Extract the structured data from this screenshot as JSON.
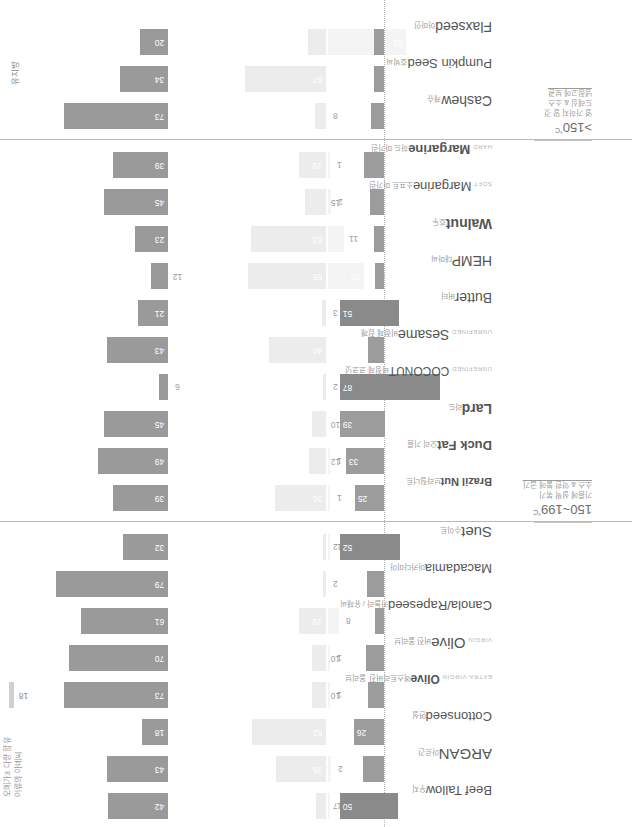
{
  "meta": {
    "fat_axis_title": "유지방",
    "omega_note_line1": "오메가3 다량 함유",
    "omega_note_line2": "어류의 아녜씨"
  },
  "colors": {
    "mono": "#9a9a9a",
    "poly": "#ececec",
    "saturated": "#9c9c9c",
    "saturated_dark": "#8a8a8a",
    "divider": "#b9b9b9",
    "zeroline": "#b0b0b0",
    "text": "#555555",
    "text_muted": "#9b9b9b"
  },
  "annotation": {
    "small_bar_value": "18"
  },
  "temperature_sections": [
    {
      "id": "sec-mid",
      "degree": "150~199",
      "unit": "°C",
      "use_lines": [
        "기름에 살짝 볶기",
        "소스 & 약한 불에 굽기"
      ]
    },
    {
      "id": "sec-low",
      "degree": ">150",
      "unit": "°C",
      "use_lines": [
        "열 가하지 말 것",
        "드레싱 & 소스",
        "냉장고에 보관"
      ]
    }
  ],
  "chart_data": {
    "type": "bar",
    "title": "유지방",
    "xlabel": "",
    "ylabel": "",
    "grid": false,
    "legend": "none",
    "series": [
      {
        "name": "monounsaturated",
        "values": [
          42,
          43,
          18,
          73,
          70,
          61,
          79,
          32,
          39,
          49,
          45,
          6,
          43,
          21,
          12,
          23,
          45,
          39,
          73,
          34,
          20
        ]
      },
      {
        "name": "polyunsaturated",
        "values": [
          7,
          35,
          52,
          10,
          10,
          19,
          2,
          2,
          36,
          12,
          10,
          2,
          40,
          3,
          55,
          53,
          15,
          19,
          8,
          57,
          13
        ]
      },
      {
        "name": "polyunsaturated_secondary",
        "values": [
          1,
          2,
          0,
          1,
          1,
          8,
          0,
          1,
          1,
          1,
          0,
          0,
          0,
          0,
          25,
          11,
          2,
          1,
          0,
          0,
          55
        ]
      },
      {
        "name": "saturated",
        "values": [
          50,
          18,
          26,
          14,
          16,
          8,
          15,
          52,
          25,
          33,
          39,
          87,
          14,
          51,
          8,
          9,
          12,
          17,
          11,
          9,
          9
        ]
      }
    ],
    "categories": [
      {
        "pre": "",
        "en": "Beef Tallow",
        "ko": "우지",
        "bold": false,
        "size": 13,
        "section": "sec-top"
      },
      {
        "pre": "",
        "en": "ARGAN",
        "ko": "아르간",
        "bold": false,
        "size": 15,
        "section": "sec-top"
      },
      {
        "pre": "",
        "en": "Cottonseed",
        "ko": "면실",
        "bold": false,
        "size": 13,
        "section": "sec-top"
      },
      {
        "pre": "EXTRA-VIRGIN",
        "en": "Olive",
        "ko": "엑스트라버진 올리브",
        "bold": true,
        "size": 12,
        "section": "sec-top"
      },
      {
        "pre": "VIRGIN",
        "en": "Olive",
        "ko": "버진 올리브",
        "bold": false,
        "size": 15,
        "section": "sec-top"
      },
      {
        "pre": "",
        "en": "Canola/Rapeseed",
        "ko": "카놀라 / 유채씨",
        "bold": false,
        "size": 13,
        "section": "sec-top"
      },
      {
        "pre": "",
        "en": "Macadamia",
        "ko": "마카다미아",
        "bold": false,
        "size": 13,
        "section": "sec-top"
      },
      {
        "pre": "",
        "en": "Suet",
        "ko": "수이트",
        "bold": false,
        "size": 15,
        "section": "sec-top"
      },
      {
        "pre": "",
        "en": "Brazil Nut",
        "ko": "브라질너트",
        "bold": true,
        "size": 11,
        "section": "sec-mid"
      },
      {
        "pre": "",
        "en": "Duck Fat",
        "ko": "오리 기름",
        "bold": true,
        "size": 13,
        "section": "sec-mid"
      },
      {
        "pre": "",
        "en": "Lard",
        "ko": "라드",
        "bold": true,
        "size": 14,
        "section": "sec-mid"
      },
      {
        "pre": "UNREFINED",
        "en": "COCONUT",
        "ko": "비정제 코코넛",
        "bold": false,
        "size": 12,
        "section": "sec-mid"
      },
      {
        "pre": "UNREFINED",
        "en": "Sesame",
        "ko": "비정제 참깨",
        "bold": false,
        "size": 14,
        "section": "sec-mid"
      },
      {
        "pre": "",
        "en": "Butter",
        "ko": "버터",
        "bold": false,
        "size": 14,
        "section": "sec-mid"
      },
      {
        "pre": "",
        "en": "HEMP",
        "ko": "대마씨",
        "bold": false,
        "size": 14,
        "section": "sec-mid"
      },
      {
        "pre": "",
        "en": "Walnut",
        "ko": "호두",
        "bold": true,
        "size": 14,
        "section": "sec-mid"
      },
      {
        "pre": "SOFT",
        "en": "Margarine",
        "ko": "소프트 마가린",
        "bold": false,
        "size": 13,
        "section": "sec-mid"
      },
      {
        "pre": "HARD",
        "en": "Margarine",
        "ko": "하드 마가린",
        "bold": true,
        "size": 13,
        "section": "sec-mid"
      },
      {
        "pre": "",
        "en": "Cashew",
        "ko": "캐슈",
        "bold": false,
        "size": 14,
        "section": "sec-low"
      },
      {
        "pre": "",
        "en": "Pumpkin Seed",
        "ko": "호박씨",
        "bold": false,
        "size": 13,
        "section": "sec-low"
      },
      {
        "pre": "",
        "en": "Flaxseed",
        "ko": "아마인",
        "bold": false,
        "size": 14,
        "section": "sec-low"
      }
    ]
  }
}
